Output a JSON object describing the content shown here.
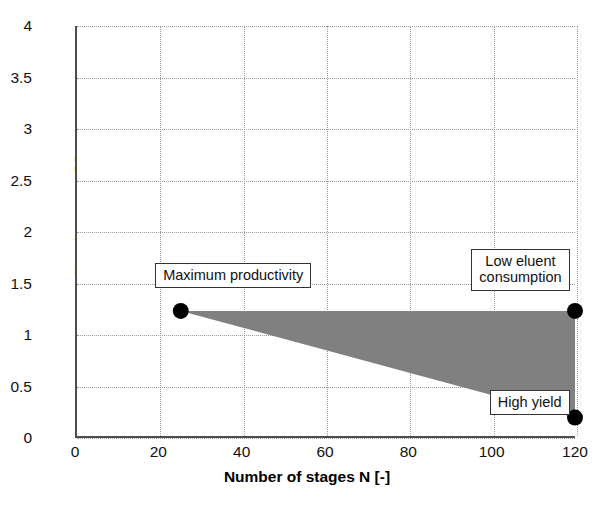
{
  "chart_data": {
    "type": "area",
    "title": "",
    "xlabel": "Number of stages N [-]",
    "ylabel": "Loading factor LF [-]",
    "xlim": [
      0,
      120
    ],
    "ylim": [
      0,
      4
    ],
    "xticks": [
      0,
      20,
      40,
      60,
      80,
      100,
      120
    ],
    "yticks": [
      0,
      0.5,
      1,
      1.5,
      2,
      2.5,
      3,
      3.5,
      4
    ],
    "xtick_labels": [
      "0",
      "20",
      "40",
      "60",
      "80",
      "100",
      "120"
    ],
    "ytick_labels": [
      "0",
      "0.5",
      "1",
      "1.5",
      "2",
      "2.5",
      "3",
      "3.5",
      "4"
    ],
    "grid": true,
    "grid_style": "dotted",
    "grid_color": "#9a9a9a",
    "legend": "none",
    "region": {
      "name": "operating-window",
      "fill_color": "#808080",
      "vertices": [
        {
          "x": 25,
          "y": 1.22
        },
        {
          "x": 120,
          "y": 1.22
        },
        {
          "x": 120,
          "y": 0.18
        }
      ]
    },
    "markers": [
      {
        "label": "Maximum productivity",
        "x": 25,
        "y": 1.22,
        "color": "#000000"
      },
      {
        "label": "Low eluent consumption",
        "x": 120,
        "y": 1.22,
        "color": "#000000"
      },
      {
        "label": "High yield",
        "x": 120,
        "y": 0.18,
        "color": "#000000"
      }
    ],
    "annotations": [
      {
        "id": "maximum-productivity",
        "text": "Maximum productivity",
        "x": 25,
        "y": 1.5
      },
      {
        "id": "low-eluent-consumption",
        "text": "Low eluent\nconsumption",
        "x": 110,
        "y": 1.62
      },
      {
        "id": "high-yield",
        "text": "High yield",
        "x": 113,
        "y": 0.33
      }
    ]
  },
  "axes": {
    "x_title": "Number of stages N [-]",
    "y_title": "Loading factor LF [-]"
  },
  "callouts": {
    "maximum_productivity": "Maximum productivity",
    "low_eluent_consumption": "Low eluent\nconsumption",
    "high_yield": "High yield"
  },
  "caption": {
    "partial_text": ""
  }
}
